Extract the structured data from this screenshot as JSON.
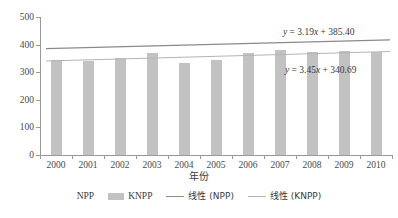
{
  "chart_data": {
    "type": "bar",
    "title": "",
    "xlabel": "年份",
    "ylabel": "",
    "categories": [
      "2000",
      "2001",
      "2002",
      "2003",
      "2004",
      "2005",
      "2006",
      "2007",
      "2008",
      "2009",
      "2010"
    ],
    "x_numeric": [
      2000,
      2001,
      2002,
      2003,
      2004,
      2005,
      2006,
      2007,
      2008,
      2009,
      2010
    ],
    "ylim": [
      0,
      500
    ],
    "y_ticks": [
      0,
      100,
      200,
      300,
      400,
      500
    ],
    "grid": false,
    "legend_position": "bottom",
    "series": [
      {
        "name": "NPP",
        "type": "bar",
        "visible": false,
        "color": "#ffffff",
        "values": [
          null,
          null,
          null,
          null,
          null,
          null,
          null,
          null,
          null,
          null,
          null
        ]
      },
      {
        "name": "KNPP",
        "type": "bar",
        "color": "#c2c2c2",
        "values": [
          344,
          342,
          352,
          371,
          335,
          345,
          369,
          382,
          373,
          376,
          374
        ]
      },
      {
        "name": "线性 (NPP)",
        "type": "line",
        "color": "#8a8a8a",
        "equation": "y = 3.19x + 385.40",
        "slope": 3.19,
        "intercept": 385.4,
        "endpoints": [
          385.4,
          417.3
        ]
      },
      {
        "name": "线性 (KNPP)",
        "type": "line",
        "color": "#b4b4b4",
        "equation": "y = 3.45x + 340.69",
        "slope": 3.45,
        "intercept": 340.69,
        "endpoints": [
          340.69,
          375.19
        ]
      }
    ],
    "annotations": [
      {
        "id": "eqn-npp",
        "text": "y = 3.19x + 385.40",
        "for": "线性 (NPP)"
      },
      {
        "id": "eqn-knpp",
        "text": "y = 3.45x + 340.69",
        "for": "线性 (KNPP)"
      }
    ]
  },
  "axis": {
    "y_tick_labels": [
      "500",
      "400",
      "300",
      "200",
      "100",
      "0"
    ],
    "x_tick_labels": [
      "2000",
      "2001",
      "2002",
      "2003",
      "2004",
      "2005",
      "2006",
      "2007",
      "2008",
      "2009",
      "2010"
    ],
    "x_title": "年份"
  },
  "equations": {
    "npp": {
      "lhs": "y",
      "eq": " = 3.19",
      "var": "x",
      "rhs": " + 385.40",
      "full": "y = 3.19x + 385.40"
    },
    "knpp": {
      "lhs": "y",
      "eq": " = 3.45",
      "var": "x",
      "rhs": " + 340.69",
      "full": "y = 3.45x + 340.69"
    }
  },
  "legend": {
    "items": [
      {
        "label": "NPP",
        "swatch": "bar-blank"
      },
      {
        "label": "KNPP",
        "swatch": "bar"
      },
      {
        "label": "线性 (NPP)",
        "swatch": "line-dark"
      },
      {
        "label": "线性 (KNPP)",
        "swatch": "line-light"
      }
    ]
  },
  "colors": {
    "bar": "#c2c2c2",
    "line_npp": "#8a8a8a",
    "line_knpp": "#b4b4b4",
    "axis": "#9a9a9a",
    "text": "#3a3a3a",
    "background": "#ffffff"
  }
}
